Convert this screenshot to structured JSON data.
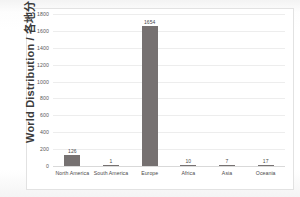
{
  "chart_data": {
    "type": "bar",
    "title": "",
    "xlabel": "",
    "ylabel": "World Distribution / 各地分布",
    "categories": [
      "North America",
      "South America",
      "Europe",
      "Africa",
      "Asia",
      "Oceania"
    ],
    "values": [
      126,
      1,
      1654,
      10,
      7,
      17
    ],
    "value_labels": [
      "126",
      "1",
      "1654",
      "10",
      "7",
      "17"
    ],
    "ylim": [
      0,
      1800
    ],
    "yticks": [
      1800,
      1600,
      1400,
      1200,
      1000,
      800,
      600,
      400,
      200,
      0
    ],
    "ytick_labels": [
      "1800",
      "1600",
      "1400",
      "1200",
      "1000",
      "800",
      "600",
      "400",
      "200",
      "0"
    ],
    "grid": true,
    "legend": false,
    "bar_color": "#767171",
    "gridline_color": "#ededed",
    "frame_color": "#e2e2e2",
    "plot_background": "#ffffff"
  }
}
